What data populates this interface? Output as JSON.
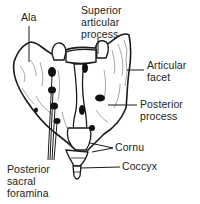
{
  "diagram": {
    "style": "black-and-white anatomical line drawing",
    "colors": {
      "background": "#ffffff",
      "ink": "#1a1a1a",
      "shading": "#6b6b6b"
    },
    "labels": {
      "ala": "Ala",
      "superior_articular_process": "Superior\narticular\nprocess",
      "articular_facet": "Articular\nfacet",
      "posterior_process": "Posterior\nprocess",
      "cornu": "Cornu",
      "coccyx": "Coccyx",
      "posterior_sacral_foramina": "Posterior\nsacral\nforamina"
    }
  }
}
